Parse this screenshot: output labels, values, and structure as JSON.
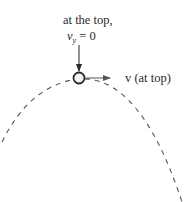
{
  "diagram": {
    "title": "at the top,",
    "vy_label": {
      "symbol": "v",
      "subscript": "y",
      "rest": " = 0"
    },
    "velocity_label": "v (at top)",
    "colors": {
      "ink": "#2a2a2a",
      "ball_fill": "#f2f2f2",
      "trajectory": "#555555"
    },
    "elements": {
      "trajectory": "dashed parabolic path",
      "ball": "projectile at apex",
      "down_arrow": "pointer to ball from label",
      "velocity_arrow": "horizontal velocity vector"
    }
  }
}
